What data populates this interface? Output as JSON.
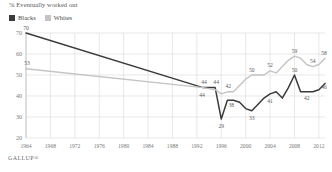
{
  "chart_data": {
    "type": "line",
    "title": "% Eventually worked out",
    "xlabel": "",
    "ylabel": "",
    "ylim": [
      20,
      70
    ],
    "yticks": [
      20,
      30,
      40,
      50,
      60,
      70
    ],
    "xlim": [
      1964,
      2013
    ],
    "xticks": [
      1964,
      1968,
      1972,
      1976,
      1980,
      1984,
      1988,
      1992,
      1996,
      2000,
      2004,
      2008,
      2012
    ],
    "grid": true,
    "legend_position": "top-left",
    "series": [
      {
        "name": "Blacks",
        "color": "#3b3b3b",
        "points": [
          {
            "x": 1964,
            "y": 70,
            "label": "70"
          },
          {
            "x": 1993,
            "y": 44,
            "label": "44"
          },
          {
            "x": 1995,
            "y": 44,
            "label": "44"
          },
          {
            "x": 1996,
            "y": 29,
            "label": "29"
          },
          {
            "x": 1997,
            "y": 38,
            "label": "38"
          },
          {
            "x": 1998,
            "y": 38,
            "label": null
          },
          {
            "x": 1999,
            "y": 37,
            "label": null
          },
          {
            "x": 2000,
            "y": 34,
            "label": null
          },
          {
            "x": 2001,
            "y": 33,
            "label": "33"
          },
          {
            "x": 2002,
            "y": 36,
            "label": null
          },
          {
            "x": 2003,
            "y": 39,
            "label": null
          },
          {
            "x": 2004,
            "y": 41,
            "label": "41"
          },
          {
            "x": 2005,
            "y": 42,
            "label": null
          },
          {
            "x": 2006,
            "y": 39,
            "label": null
          },
          {
            "x": 2007,
            "y": 44,
            "label": null
          },
          {
            "x": 2008,
            "y": 50,
            "label": "50"
          },
          {
            "x": 2009,
            "y": 42,
            "label": null
          },
          {
            "x": 2010,
            "y": 42,
            "label": "42"
          },
          {
            "x": 2011,
            "y": 42,
            "label": null
          },
          {
            "x": 2012,
            "y": 43,
            "label": null
          },
          {
            "x": 2013,
            "y": 46,
            "label": "46"
          }
        ]
      },
      {
        "name": "Whites",
        "color": "#c4c4c4",
        "points": [
          {
            "x": 1964,
            "y": 53,
            "label": "53"
          },
          {
            "x": 1993,
            "y": 44,
            "label": "44"
          },
          {
            "x": 1995,
            "y": 43,
            "label": null
          },
          {
            "x": 1996,
            "y": 41,
            "label": null
          },
          {
            "x": 1997,
            "y": 42,
            "label": "42"
          },
          {
            "x": 1998,
            "y": 42,
            "label": null
          },
          {
            "x": 1999,
            "y": 45,
            "label": null
          },
          {
            "x": 2000,
            "y": 48,
            "label": null
          },
          {
            "x": 2001,
            "y": 50,
            "label": "50"
          },
          {
            "x": 2002,
            "y": 50,
            "label": null
          },
          {
            "x": 2003,
            "y": 50,
            "label": null
          },
          {
            "x": 2004,
            "y": 52,
            "label": "52"
          },
          {
            "x": 2005,
            "y": 51,
            "label": null
          },
          {
            "x": 2006,
            "y": 54,
            "label": null
          },
          {
            "x": 2007,
            "y": 57,
            "label": null
          },
          {
            "x": 2008,
            "y": 59,
            "label": "59"
          },
          {
            "x": 2009,
            "y": 58,
            "label": null
          },
          {
            "x": 2010,
            "y": 55,
            "label": null
          },
          {
            "x": 2011,
            "y": 54,
            "label": "54"
          },
          {
            "x": 2012,
            "y": 55,
            "label": null
          },
          {
            "x": 2013,
            "y": 58,
            "label": "58"
          }
        ]
      }
    ]
  },
  "legend": {
    "items": [
      {
        "label": "Blacks",
        "color": "#3b3b3b"
      },
      {
        "label": "Whites",
        "color": "#c4c4c4"
      }
    ]
  },
  "footer": {
    "source": "GALLUP®"
  },
  "colors": {
    "blacks": "#3b3b3b",
    "whites": "#c4c4c4",
    "grid": "#d8d8d8",
    "axis_text": "#787878",
    "title_text": "#555555"
  }
}
